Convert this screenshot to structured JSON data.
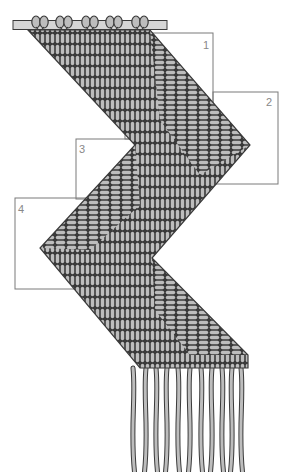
{
  "diagram": {
    "colors": {
      "cord_fill": "#bdbdbd",
      "cord_outline": "#3a3a3a",
      "box_line": "#7a7a7a",
      "label_text": "#888888",
      "background": "#ffffff"
    },
    "dowel": {
      "x1": 13,
      "x2": 167,
      "y": 25,
      "thickness": 9
    },
    "mounting_knots": {
      "count": 5,
      "x_positions": [
        40,
        64,
        90,
        114,
        140
      ],
      "y": 22
    },
    "outline_points": [
      [
        28,
        30
      ],
      [
        150,
        30
      ],
      [
        250,
        145
      ],
      [
        152,
        258
      ],
      [
        248,
        355
      ],
      [
        248,
        368
      ],
      [
        140,
        368
      ],
      [
        40,
        248
      ],
      [
        135,
        145
      ],
      [
        28,
        30
      ]
    ],
    "fringe": {
      "count": 11,
      "top_y": 368,
      "bottom_y": 472,
      "x_positions": [
        133,
        146,
        156,
        167,
        178,
        190,
        201,
        212,
        222,
        232,
        241
      ]
    },
    "section_boxes": [
      {
        "id": "1",
        "label": "1",
        "x": 125,
        "y": 33,
        "w": 88,
        "h": 106,
        "label_x": 203,
        "label_y": 40
      },
      {
        "id": "2",
        "label": "2",
        "x": 213,
        "y": 92,
        "w": 65,
        "h": 92,
        "label_x": 266,
        "label_y": 97
      },
      {
        "id": "3",
        "label": "3",
        "x": 76,
        "y": 139,
        "w": 100,
        "h": 60,
        "label_x": 79,
        "label_y": 144
      },
      {
        "id": "4",
        "label": "4",
        "x": 15,
        "y": 198,
        "w": 100,
        "h": 91,
        "label_x": 18,
        "label_y": 204
      }
    ]
  }
}
